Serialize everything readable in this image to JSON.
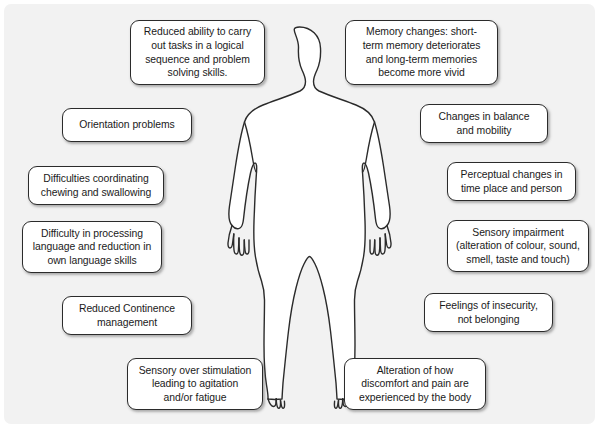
{
  "diagram": {
    "type": "annotated-body-diagram",
    "background_color": "#f2f2f2",
    "panel_border_radius": "7px",
    "box_fill_color": "#ffffff",
    "box_border_color": "#2b2b2b",
    "text_color": "#1a1a1a",
    "figure": {
      "name": "human-body-silhouette",
      "description": "Front-facing outline of a standing human figure with arms at the sides, fingers and toes drawn",
      "fill_color": "#ffffff",
      "stroke_color": "#2b2b2b"
    },
    "boxes": [
      {
        "id": "reduced-ability-tasks",
        "side": "left",
        "lines": [
          "Reduced ability to carry",
          "out tasks in a logical",
          "sequence and problem",
          "solving skills."
        ],
        "x": 130,
        "y": 20,
        "w": 135,
        "h": 65
      },
      {
        "id": "memory-changes",
        "side": "right",
        "lines": [
          "Memory changes: short-",
          "term memory deteriorates",
          "and long-term memories",
          "become more vivid"
        ],
        "x": 345,
        "y": 20,
        "w": 153,
        "h": 65
      },
      {
        "id": "orientation-problems",
        "side": "left",
        "lines": [
          "Orientation problems"
        ],
        "x": 62,
        "y": 108,
        "w": 130,
        "h": 34
      },
      {
        "id": "changes-balance-mobility",
        "side": "right",
        "lines": [
          "Changes in balance",
          "and mobility"
        ],
        "x": 420,
        "y": 104,
        "w": 128,
        "h": 39
      },
      {
        "id": "difficulties-chewing-swallowing",
        "side": "left",
        "lines": [
          "Difficulties coordinating",
          "chewing and swallowing"
        ],
        "x": 28,
        "y": 166,
        "w": 136,
        "h": 39
      },
      {
        "id": "perceptual-changes",
        "side": "right",
        "lines": [
          "Perceptual changes in",
          "time place and person"
        ],
        "x": 447,
        "y": 162,
        "w": 129,
        "h": 39
      },
      {
        "id": "difficulty-processing-language",
        "side": "left",
        "lines": [
          "Difficulty in processing",
          "language and reduction in",
          "own language skills"
        ],
        "x": 22,
        "y": 221,
        "w": 140,
        "h": 52
      },
      {
        "id": "sensory-impairment",
        "side": "right",
        "lines": [
          "Sensory impairment",
          "(alteration of colour, sound,",
          "smell, taste and touch)"
        ],
        "x": 447,
        "y": 220,
        "w": 142,
        "h": 52
      },
      {
        "id": "reduced-continence-management",
        "side": "left",
        "lines": [
          "Reduced Continence",
          "management"
        ],
        "x": 62,
        "y": 296,
        "w": 130,
        "h": 39
      },
      {
        "id": "feelings-of-insecurity",
        "side": "right",
        "lines": [
          "Feelings of insecurity,",
          "not belonging"
        ],
        "x": 424,
        "y": 293,
        "w": 129,
        "h": 39
      },
      {
        "id": "sensory-over-stimulation",
        "side": "left",
        "lines": [
          "Sensory over stimulation",
          "leading to agitation",
          "and/or fatigue"
        ],
        "x": 127,
        "y": 358,
        "w": 136,
        "h": 52
      },
      {
        "id": "alteration-discomfort-pain",
        "side": "right",
        "lines": [
          "Alteration of how",
          "discomfort and pain are",
          "experienced by the body"
        ],
        "x": 344,
        "y": 358,
        "w": 142,
        "h": 52
      }
    ]
  }
}
